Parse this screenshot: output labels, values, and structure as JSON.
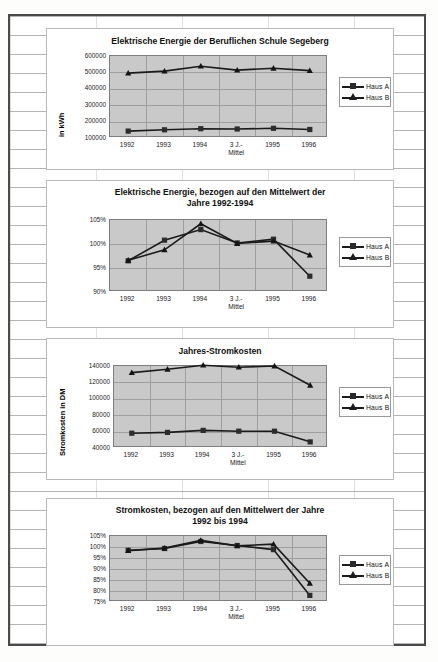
{
  "document": {
    "type": "scanned-spreadsheet-page",
    "categories": [
      "1992",
      "1993",
      "1994",
      "3 J.-",
      "1995",
      "1996"
    ],
    "category_second_line": "Mittel",
    "legend": {
      "series_a": "Haus A",
      "series_b": "Haus B"
    }
  },
  "chart_data": [
    {
      "type": "line",
      "title": "Elektrische Energie der Beruflichen Schule Segeberg",
      "xlabel": "",
      "ylabel": "in kWh",
      "categories": [
        "1992",
        "1993",
        "1994",
        "3 J.-\nMittel",
        "1995",
        "1996"
      ],
      "yticks": [
        100000,
        200000,
        300000,
        400000,
        500000,
        600000
      ],
      "ylim": [
        100000,
        600000
      ],
      "grid": true,
      "legend_position": "right",
      "series": [
        {
          "name": "Haus A",
          "marker": "square",
          "values": [
            142000,
            150000,
            157000,
            155000,
            159000,
            152000
          ]
        },
        {
          "name": "Haus B",
          "marker": "triangle",
          "values": [
            496000,
            508000,
            538000,
            514000,
            525000,
            511000
          ]
        }
      ]
    },
    {
      "type": "line",
      "title": "Elektrische Energie, bezogen auf den Mittelwert der Jahre 1992-1994",
      "xlabel": "",
      "ylabel": "",
      "categories": [
        "1992",
        "1993",
        "1994",
        "3 J.-\nMittel",
        "1995",
        "1996"
      ],
      "yticks": [
        "90%",
        "95%",
        "100%",
        "105%"
      ],
      "ylim": [
        90,
        105
      ],
      "grid": true,
      "legend_position": "right",
      "series": [
        {
          "name": "Haus A",
          "marker": "square",
          "values": [
            96.5,
            100.8,
            103.0,
            100.2,
            101.0,
            93.3
          ]
        },
        {
          "name": "Haus B",
          "marker": "triangle",
          "values": [
            96.6,
            98.8,
            104.2,
            100.1,
            100.6,
            97.7
          ]
        }
      ]
    },
    {
      "type": "line",
      "title": "Jahres-Stromkosten",
      "xlabel": "",
      "ylabel": "Stromkosten in DM",
      "categories": [
        "1992",
        "1993",
        "1994",
        "3 J.-\nMittel",
        "1995",
        "1996"
      ],
      "yticks": [
        40000,
        60000,
        80000,
        100000,
        120000,
        140000
      ],
      "ylim": [
        40000,
        140000
      ],
      "grid": true,
      "legend_position": "right",
      "series": [
        {
          "name": "Haus A",
          "marker": "square",
          "values": [
            58000,
            59000,
            61500,
            60500,
            60500,
            47500
          ]
        },
        {
          "name": "Haus B",
          "marker": "triangle",
          "values": [
            132000,
            136000,
            141000,
            138500,
            140000,
            116500
          ]
        }
      ]
    },
    {
      "type": "line",
      "title": "Stromkosten, bezogen auf den Mittelwert der Jahre 1992 bis 1994",
      "xlabel": "",
      "ylabel": "",
      "categories": [
        "1992",
        "1993",
        "1994",
        "3 J.-\nMittel",
        "1995",
        "1996"
      ],
      "yticks": [
        "75%",
        "80%",
        "85%",
        "90%",
        "95%",
        "100%",
        "105%"
      ],
      "ylim": [
        75,
        105
      ],
      "grid": true,
      "legend_position": "right",
      "series": [
        {
          "name": "Haus A",
          "marker": "square",
          "values": [
            98.5,
            99.3,
            102.5,
            100.7,
            98.8,
            78.0
          ]
        },
        {
          "name": "Haus B",
          "marker": "triangle",
          "values": [
            98.3,
            99.5,
            103.0,
            100.5,
            101.3,
            83.5
          ]
        }
      ]
    }
  ],
  "charts_meta": [
    {
      "title_lines": [
        "Elektrische Energie der Beruflichen Schule Segeberg"
      ]
    },
    {
      "title_lines": [
        "Elektrische Energie, bezogen auf den Mittelwert der",
        "Jahre 1992-1994"
      ]
    },
    {
      "title_lines": [
        "Jahres-Stromkosten"
      ]
    },
    {
      "title_lines": [
        "Stromkosten, bezogen auf den Mittelwert der Jahre",
        "1992 bis 1994"
      ]
    }
  ]
}
